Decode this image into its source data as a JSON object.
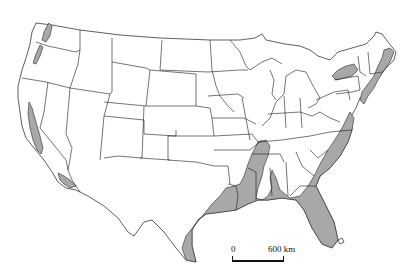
{
  "map": {
    "region": "Contiguous United States",
    "style": "state outline map with shaded distribution areas",
    "colors": {
      "background": "#ffffff",
      "land": "#ffffff",
      "borders": "#1a1a1a",
      "shaded_range": "#a8a8a8"
    },
    "shaded_regions": [
      "Puget Sound lowlands (Washington)",
      "Willamette Valley (Oregon)",
      "Central Valley (California)",
      "Southern California coast",
      "Gulf Coastal Plain (Texas to Florida)",
      "Mississippi Embayment (north to southern Illinois)",
      "Florida peninsula",
      "Atlantic Coastal Plain (Georgia to New Jersey)",
      "Lower Hudson / New England coast",
      "Lake Ontario / St. Lawrence lowlands"
    ],
    "scale_bar": {
      "start_label": "0",
      "end_label": "600 km"
    }
  }
}
